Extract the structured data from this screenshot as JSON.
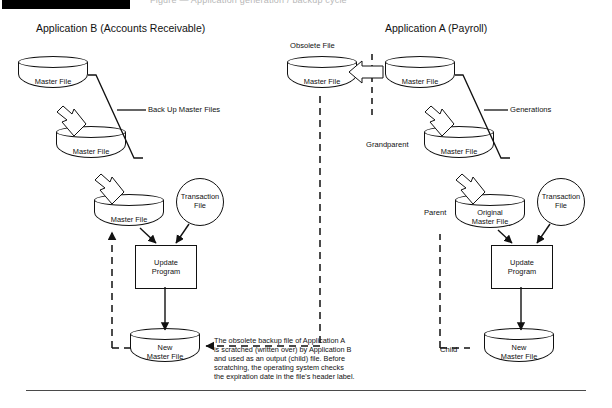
{
  "header": {
    "redacted_bar": "",
    "clipped_text": "Figure — Application generation / backup cycle"
  },
  "diagrams": {
    "left": {
      "title": "Application B (Accounts Receivable)",
      "annotation": "Back Up Master Files",
      "nodes": {
        "master_top": "Master File",
        "master_mid": "Master File",
        "master_bottom": "Master File",
        "transaction": "Transaction\nFile",
        "transaction_line1": "Transaction",
        "transaction_line2": "File",
        "program_line1": "Update",
        "program_line2": "Program",
        "new_master_line1": "New",
        "new_master_line2": "Master File"
      }
    },
    "right": {
      "title": "Application A (Payroll)",
      "annotation": "Generations",
      "labels": {
        "obsolete": "Obsolete File",
        "grandparent": "Grandparent",
        "parent": "Parent",
        "child": "Child"
      },
      "nodes": {
        "obsolete_master": "Master File",
        "master_top": "Master File",
        "master_grandparent": "Master File",
        "original_master_line1": "Original",
        "original_master_line2": "Master File",
        "transaction_line1": "Transaction",
        "transaction_line2": "File",
        "program_line1": "Update",
        "program_line2": "Program",
        "new_master_line1": "New",
        "new_master_line2": "Master File"
      }
    }
  },
  "caption": "The obsolete backup file of Application A\nis scratched (written over) by Application B\nand used as an output (child) file.  Before\nscratching, the operating system checks\nthe expiration date in the file's header label.",
  "colors": {
    "stroke": "#111111",
    "paper": "#ffffff",
    "rule": "#4a4a4a"
  }
}
